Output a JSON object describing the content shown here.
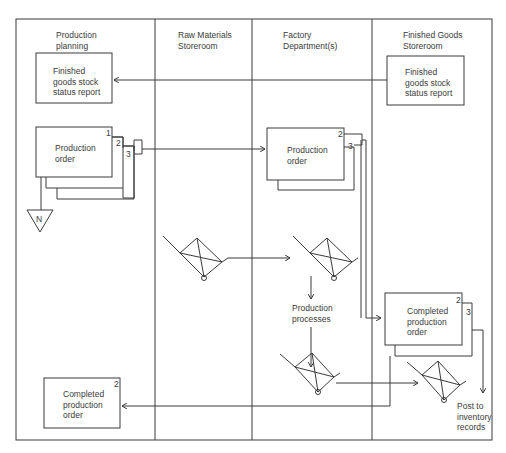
{
  "lanes": [
    {
      "id": "production-planning",
      "title_line1": "Production",
      "title_line2": "planning"
    },
    {
      "id": "raw-materials",
      "title_line1": "Raw Materials",
      "title_line2": "Storeroom"
    },
    {
      "id": "factory",
      "title_line1": "Factory",
      "title_line2": "Department(s)"
    },
    {
      "id": "finished-goods",
      "title_line1": "Finished Goods",
      "title_line2": "Storeroom"
    }
  ],
  "documents": {
    "pp_status_report": {
      "line1": "Finished",
      "line2": "goods stock",
      "line3": "status report"
    },
    "fg_status_report": {
      "line1": "Finished",
      "line2": "goods stock",
      "line3": "status report"
    },
    "pp_production_order": {
      "line1": "Production",
      "line2": "order",
      "copies": [
        "1",
        "2",
        "3"
      ]
    },
    "factory_production_order": {
      "line1": "Production",
      "line2": "order",
      "copies": [
        "2",
        "3"
      ]
    },
    "fg_completed_order": {
      "line1": "Completed",
      "line2": "production",
      "line3": "order",
      "copies": [
        "2",
        "3"
      ]
    },
    "pp_completed_order": {
      "line1": "Completed",
      "line2": "production",
      "line3": "order",
      "copy": "2"
    }
  },
  "file_symbol": {
    "label": "N"
  },
  "process": {
    "line1": "Production",
    "line2": "processes"
  },
  "terminal_note": {
    "line1": "Post to",
    "line2": "inventory",
    "line3": "records"
  },
  "colors": {
    "line": "#3a3a3a",
    "background": "#ffffff"
  }
}
